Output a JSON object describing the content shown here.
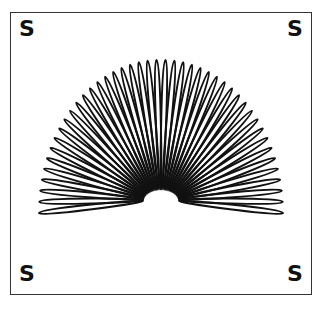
{
  "illustration": {
    "subject": "Slinky spring toy bent in an arch",
    "loop_count": 44,
    "stroke_color": "#111111",
    "background": "#ffffff"
  },
  "corners": {
    "top_left": "S",
    "top_right": "S",
    "bottom_left": "S",
    "bottom_right": "S"
  }
}
